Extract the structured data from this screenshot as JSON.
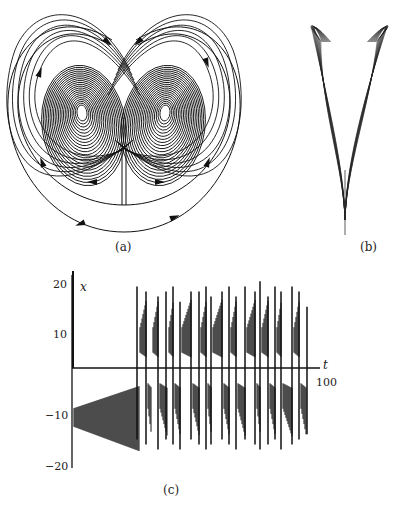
{
  "figure": {
    "panels": [
      {
        "id": "a",
        "caption": "(a)",
        "description": "Phase portrait of Lorenz attractor, x-z projection with flow arrows"
      },
      {
        "id": "b",
        "caption": "(b)",
        "description": "Lorenz attractor viewed edge-on, V-shaped projection"
      },
      {
        "id": "c",
        "caption": "(c)",
        "description": "Time series x(t)"
      }
    ]
  },
  "chart_data": [
    {
      "type": "line",
      "title": "(c)",
      "xlabel": "t",
      "ylabel": "x",
      "x_ticks": [
        "100"
      ],
      "y_ticks": [
        "20",
        "10",
        "-10",
        "-20"
      ],
      "xlim": [
        0,
        100
      ],
      "ylim": [
        -20,
        20
      ],
      "grid": false,
      "series": [
        {
          "name": "x(t)",
          "description": "Initial damped oscillation near x≈-10 growing until t≈18, then chaotic switching between lobes near +10 and -10 with spikes to about ±17"
        }
      ]
    }
  ],
  "labels": {
    "cap_a": "(a)",
    "cap_b": "(b)",
    "cap_c": "(c)",
    "y_var": "x",
    "x_var": "t",
    "tick_20": "20",
    "tick_10": "10",
    "tick_m10": "−10",
    "tick_m20": "−20",
    "tick_100": "100"
  }
}
